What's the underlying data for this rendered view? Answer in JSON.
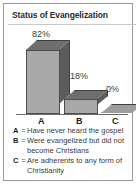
{
  "chart_data": {
    "type": "bar",
    "title": "Status of Evangelization",
    "categories": [
      "A",
      "B",
      "C"
    ],
    "values": [
      82,
      18,
      0
    ],
    "value_labels": [
      "82%",
      "18%",
      "0%"
    ],
    "xlabel": "",
    "ylabel": "",
    "ylim": [
      0,
      100
    ],
    "grid": false,
    "legend_position": "below",
    "style": "3d-column",
    "colors": {
      "bar_front": "#a9a9a9",
      "bar_side": "#5c5c5c",
      "bar_top": "#6e6e6e",
      "outline": "#4d4d4d",
      "frame": "#9a9a9a",
      "text": "#3a3a3a",
      "background": "#ffffff"
    },
    "legend": [
      {
        "key": "A",
        "eq": "=",
        "text": "Have never heard the gospel"
      },
      {
        "key": "B",
        "eq": "=",
        "text": "Were evangelized but did not become Christians"
      },
      {
        "key": "C",
        "eq": "=",
        "text": "Are adherents to any form of Christianity"
      }
    ]
  }
}
